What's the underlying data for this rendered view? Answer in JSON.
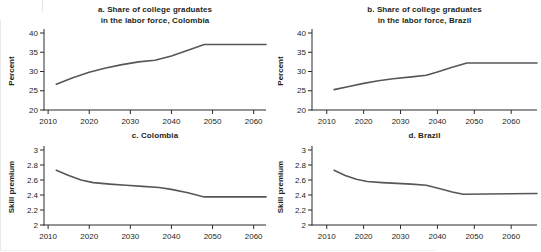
{
  "figure": {
    "background": "#ffffff",
    "text_color": "#231f20",
    "line_color": "#57575a",
    "axis_color": "#2d2b2c"
  },
  "chart_data": [
    {
      "id": "a",
      "type": "line",
      "title_lines": [
        "a. Share of college graduates",
        "in the labor force, Colombia"
      ],
      "ylabel": "Percent",
      "xlabel": "",
      "xlim": [
        2009,
        2063
      ],
      "ylim": [
        20,
        40
      ],
      "xticks": [
        2010,
        2020,
        2030,
        2040,
        2050,
        2060
      ],
      "yticks": [
        20,
        25,
        30,
        35,
        40
      ],
      "grid": false,
      "legend": "none",
      "series": [
        {
          "name": "Colombia college graduate share",
          "points": [
            [
              2012,
              26.7
            ],
            [
              2016,
              28.4
            ],
            [
              2020,
              29.8
            ],
            [
              2024,
              30.9
            ],
            [
              2028,
              31.8
            ],
            [
              2032,
              32.5
            ],
            [
              2036,
              32.9
            ],
            [
              2040,
              34.0
            ],
            [
              2044,
              35.5
            ],
            [
              2048,
              37.0
            ],
            [
              2063,
              37.0
            ]
          ]
        }
      ]
    },
    {
      "id": "b",
      "type": "line",
      "title_lines": [
        "b. Share of college graduates",
        "in the labor force, Brazil"
      ],
      "ylabel": "Percent",
      "xlabel": "",
      "xlim": [
        2006,
        2067
      ],
      "ylim": [
        20,
        40
      ],
      "xticks": [
        2010,
        2020,
        2030,
        2040,
        2050,
        2060
      ],
      "yticks": [
        20,
        25,
        30,
        35,
        40
      ],
      "grid": false,
      "legend": "none",
      "series": [
        {
          "name": "Brazil college graduate share",
          "points": [
            [
              2012,
              25.3
            ],
            [
              2016,
              26.1
            ],
            [
              2020,
              26.9
            ],
            [
              2024,
              27.6
            ],
            [
              2028,
              28.1
            ],
            [
              2033,
              28.6
            ],
            [
              2037,
              29.0
            ],
            [
              2040,
              29.9
            ],
            [
              2044,
              31.1
            ],
            [
              2048,
              32.2
            ],
            [
              2067,
              32.2
            ]
          ]
        }
      ]
    },
    {
      "id": "c",
      "type": "line",
      "title_lines": [
        "c. Colombia"
      ],
      "ylabel": "Skill premium",
      "xlabel": "",
      "xlim": [
        2009,
        2063
      ],
      "ylim": [
        2,
        3
      ],
      "xticks": [
        2010,
        2020,
        2030,
        2040,
        2050,
        2060
      ],
      "yticks": [
        2,
        2.2,
        2.4,
        2.6,
        2.8,
        3
      ],
      "grid": false,
      "legend": "none",
      "series": [
        {
          "name": "Colombia skill premium",
          "points": [
            [
              2012,
              2.73
            ],
            [
              2015,
              2.66
            ],
            [
              2018,
              2.6
            ],
            [
              2021,
              2.565
            ],
            [
              2025,
              2.545
            ],
            [
              2029,
              2.53
            ],
            [
              2033,
              2.515
            ],
            [
              2037,
              2.5
            ],
            [
              2040,
              2.475
            ],
            [
              2044,
              2.43
            ],
            [
              2048,
              2.375
            ],
            [
              2063,
              2.375
            ]
          ]
        }
      ]
    },
    {
      "id": "d",
      "type": "line",
      "title_lines": [
        "d. Brazil"
      ],
      "ylabel": "Skill premium",
      "xlabel": "",
      "xlim": [
        2006,
        2067
      ],
      "ylim": [
        2,
        3
      ],
      "xticks": [
        2010,
        2020,
        2030,
        2040,
        2050,
        2060
      ],
      "yticks": [
        2,
        2.2,
        2.4,
        2.6,
        2.8,
        3
      ],
      "grid": false,
      "legend": "none",
      "series": [
        {
          "name": "Brazil skill premium",
          "points": [
            [
              2012,
              2.73
            ],
            [
              2015,
              2.66
            ],
            [
              2018,
              2.61
            ],
            [
              2021,
              2.58
            ],
            [
              2025,
              2.565
            ],
            [
              2029,
              2.555
            ],
            [
              2033,
              2.545
            ],
            [
              2037,
              2.53
            ],
            [
              2041,
              2.48
            ],
            [
              2044,
              2.44
            ],
            [
              2047,
              2.41
            ],
            [
              2067,
              2.42
            ]
          ]
        }
      ]
    }
  ]
}
